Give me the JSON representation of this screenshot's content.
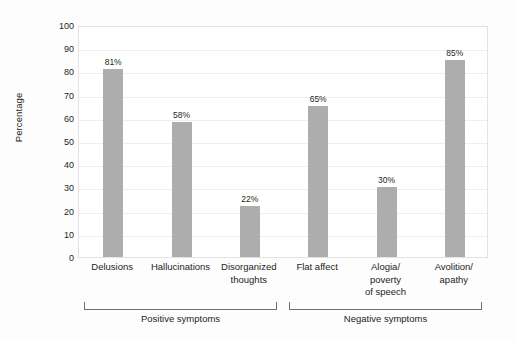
{
  "chart_data": {
    "type": "bar",
    "title": "",
    "xlabel": "",
    "ylabel": "Percentage",
    "ylim": [
      0,
      100
    ],
    "ytick_step": 10,
    "grid": true,
    "legend": "none",
    "bar_color": "#adadad",
    "categories": [
      "Delusions",
      "Hallucinations",
      "Disorganized thoughts",
      "Flat affect",
      "Alogia/ poverty of speech",
      "Avolition/ apathy"
    ],
    "values": [
      81,
      58,
      22,
      65,
      30,
      85
    ],
    "value_labels": [
      "81%",
      "58%",
      "22%",
      "65%",
      "30%",
      "85%"
    ],
    "ytick_labels": [
      "100",
      "90",
      "80",
      "70",
      "60",
      "50",
      "40",
      "30",
      "20",
      "10",
      "0"
    ],
    "groups": [
      {
        "label": "Positive symptoms",
        "members": [
          "Delusions",
          "Hallucinations",
          "Disorganized thoughts"
        ]
      },
      {
        "label": "Negative symptoms",
        "members": [
          "Flat affect",
          "Alogia/ poverty of speech",
          "Avolition/ apathy"
        ]
      }
    ]
  },
  "axis": {
    "y_title": "Percentage",
    "ticks": [
      {
        "label": "100",
        "value": 100
      },
      {
        "label": "90",
        "value": 90
      },
      {
        "label": "80",
        "value": 80
      },
      {
        "label": "70",
        "value": 70
      },
      {
        "label": "60",
        "value": 60
      },
      {
        "label": "50",
        "value": 50
      },
      {
        "label": "40",
        "value": 40
      },
      {
        "label": "30",
        "value": 30
      },
      {
        "label": "20",
        "value": 20
      },
      {
        "label": "10",
        "value": 10
      },
      {
        "label": "0",
        "value": 0
      }
    ]
  },
  "bars": [
    {
      "name": "delusions",
      "label_line1": "Delusions",
      "label_line2": "",
      "label_line3": "",
      "value": 81,
      "value_label": "81%"
    },
    {
      "name": "hallucinations",
      "label_line1": "Hallucinations",
      "label_line2": "",
      "label_line3": "",
      "value": 58,
      "value_label": "58%"
    },
    {
      "name": "disorganized-thoughts",
      "label_line1": "Disorganized",
      "label_line2": "thoughts",
      "label_line3": "",
      "value": 22,
      "value_label": "22%"
    },
    {
      "name": "flat-affect",
      "label_line1": "Flat affect",
      "label_line2": "",
      "label_line3": "",
      "value": 65,
      "value_label": "65%"
    },
    {
      "name": "alogia",
      "label_line1": "Alogia/",
      "label_line2": "poverty",
      "label_line3": "of speech",
      "value": 30,
      "value_label": "30%"
    },
    {
      "name": "avolition",
      "label_line1": "Avolition/",
      "label_line2": "apathy",
      "label_line3": "",
      "value": 85,
      "value_label": "85%"
    }
  ],
  "groups": [
    {
      "name": "positive-symptoms",
      "label": "Positive symptoms"
    },
    {
      "name": "negative-symptoms",
      "label": "Negative symptoms"
    }
  ]
}
